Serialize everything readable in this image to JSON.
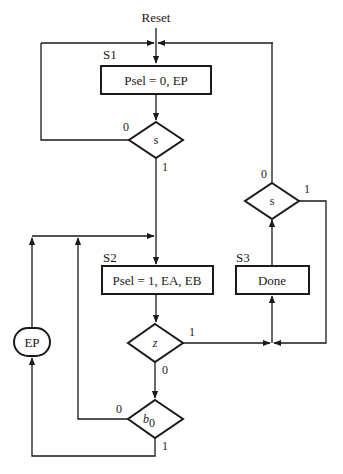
{
  "diagram": {
    "type": "ASM chart",
    "entry_label": "Reset",
    "states": [
      {
        "name": "S1",
        "action": "Psel = 0, EP"
      },
      {
        "name": "S2",
        "action": "Psel = 1, EA, EB"
      },
      {
        "name": "S3",
        "action": "Done"
      }
    ],
    "decisions": [
      {
        "id": "s_in_s1",
        "condition": "s",
        "branch_0": "0",
        "branch_1": "1"
      },
      {
        "id": "z",
        "condition": "z",
        "branch_0": "0",
        "branch_1": "1"
      },
      {
        "id": "b0",
        "condition_base": "b",
        "condition_sub": "0",
        "branch_0": "0",
        "branch_1": "1"
      },
      {
        "id": "s_in_s3",
        "condition": "s",
        "branch_0": "0",
        "branch_1": "1"
      }
    ],
    "conditional_outputs": [
      {
        "id": "ep",
        "label": "EP"
      }
    ]
  }
}
